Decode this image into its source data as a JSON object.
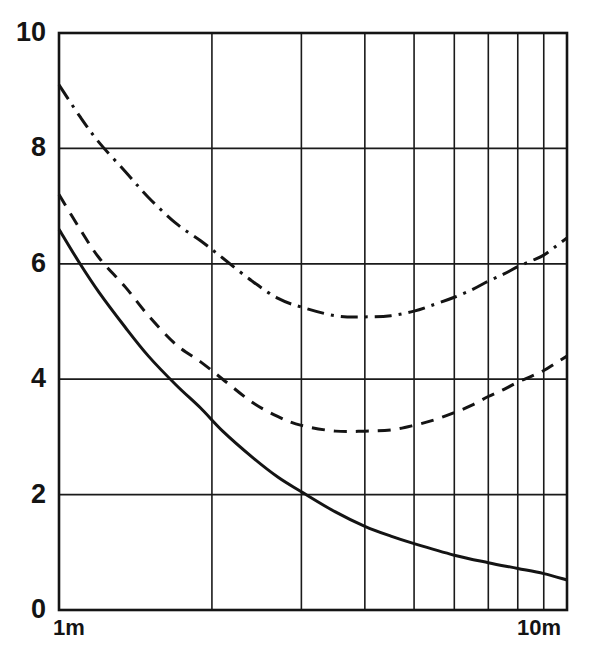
{
  "chart_data": {
    "type": "line",
    "title": "",
    "subtitle": "",
    "xlabel": "",
    "ylabel": "",
    "xscale": "log",
    "yscale": "linear",
    "xlim": [
      1,
      10
    ],
    "ylim": [
      0,
      10
    ],
    "x_axis_unit": "m",
    "x_tick_labels": [
      "1m",
      "10m"
    ],
    "x_tick_values": [
      1,
      10
    ],
    "x_minor_gridline_values": [
      2,
      3,
      4,
      5,
      6,
      7,
      8,
      9
    ],
    "y_tick_labels": [
      "0",
      "2",
      "4",
      "6",
      "8",
      "10"
    ],
    "y_tick_values": [
      0,
      2,
      4,
      6,
      8,
      10
    ],
    "y_gridline_values": [
      2,
      4,
      6,
      8
    ],
    "grid": true,
    "legend": "none",
    "annotations": [],
    "series": [
      {
        "name": "solid-curve",
        "style": "solid",
        "color": "#141414",
        "x": [
          1.0,
          1.1,
          1.2,
          1.35,
          1.5,
          1.7,
          1.9,
          2.1,
          2.4,
          2.7,
          3.0,
          3.5,
          4.0,
          4.5,
          5.0,
          6.0,
          7.0,
          8.0,
          9.0,
          10.0
        ],
        "values": [
          6.6,
          6.0,
          5.5,
          4.9,
          4.4,
          3.9,
          3.5,
          3.1,
          2.65,
          2.3,
          2.05,
          1.7,
          1.45,
          1.28,
          1.15,
          0.95,
          0.82,
          0.72,
          0.63,
          0.52
        ]
      },
      {
        "name": "dashed-curve",
        "style": "dashed",
        "color": "#141414",
        "x": [
          1.0,
          1.1,
          1.2,
          1.35,
          1.5,
          1.7,
          1.9,
          2.1,
          2.4,
          2.7,
          3.0,
          3.5,
          4.0,
          4.5,
          5.0,
          5.5,
          6.0,
          6.5,
          7.0,
          7.5,
          8.0,
          8.5,
          9.0,
          9.5,
          10.0
        ],
        "values": [
          7.2,
          6.6,
          6.1,
          5.6,
          5.1,
          4.6,
          4.3,
          4.0,
          3.6,
          3.35,
          3.2,
          3.1,
          3.1,
          3.12,
          3.2,
          3.3,
          3.42,
          3.55,
          3.7,
          3.82,
          3.95,
          4.05,
          4.15,
          4.28,
          4.4
        ]
      },
      {
        "name": "dash-dot-curve",
        "style": "dashdot",
        "color": "#141414",
        "x": [
          1.0,
          1.1,
          1.2,
          1.35,
          1.5,
          1.7,
          1.9,
          2.1,
          2.4,
          2.7,
          3.0,
          3.5,
          4.0,
          4.5,
          5.0,
          5.5,
          6.0,
          6.5,
          7.0,
          7.5,
          8.0,
          8.5,
          9.0,
          9.5,
          10.0
        ],
        "values": [
          9.1,
          8.55,
          8.1,
          7.6,
          7.15,
          6.7,
          6.4,
          6.1,
          5.7,
          5.4,
          5.25,
          5.1,
          5.08,
          5.1,
          5.18,
          5.3,
          5.42,
          5.55,
          5.7,
          5.82,
          5.95,
          6.05,
          6.15,
          6.3,
          6.45
        ]
      }
    ]
  }
}
